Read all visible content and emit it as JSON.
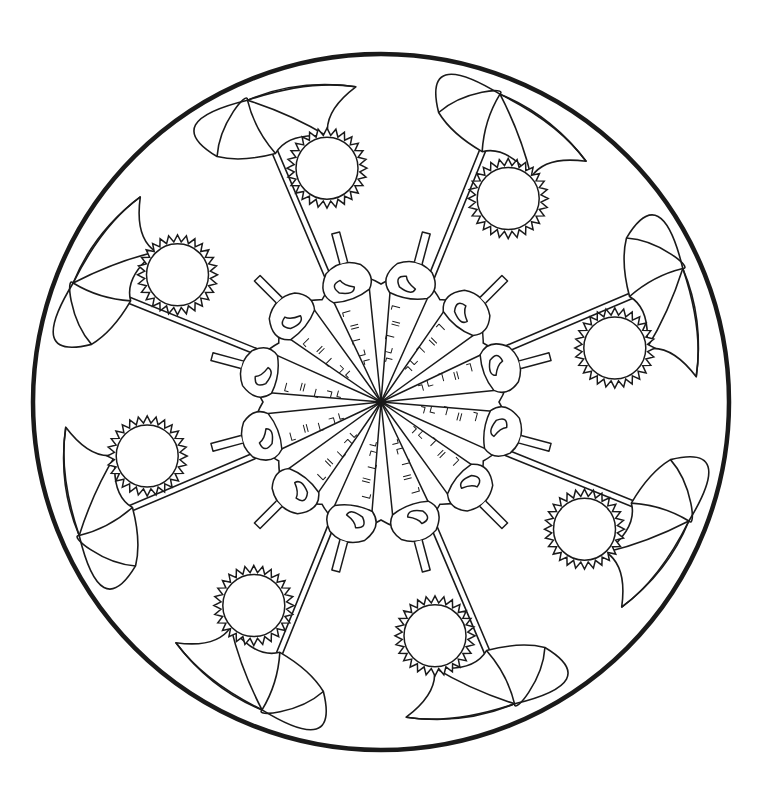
{
  "colors": {
    "background": "#ffffff",
    "ink": "#1a1a1a"
  },
  "mandala": {
    "center": [
      381,
      402
    ],
    "outer_radius": 348,
    "umbrellas": {
      "count": 8,
      "start_angle_deg": -68
    },
    "suns": {
      "count": 8,
      "start_angle_deg": -103,
      "radius_from_center": 240
    },
    "cones": {
      "count": 12,
      "start_angle_deg": -75,
      "length": 130
    }
  }
}
